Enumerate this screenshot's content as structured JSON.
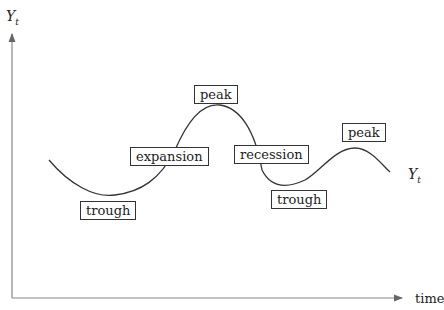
{
  "diagram": {
    "y_axis_label": "Y",
    "y_axis_subscript": "t",
    "x_axis_label": "time",
    "curve_label": "Y",
    "curve_label_subscript": "t",
    "labels": {
      "peak1": "peak",
      "expansion": "expansion",
      "recession": "recession",
      "trough1": "trough",
      "trough2": "trough",
      "peak2": "peak"
    },
    "colors": {
      "axis": "#777777",
      "curve": "#333333",
      "text": "#222222"
    }
  }
}
